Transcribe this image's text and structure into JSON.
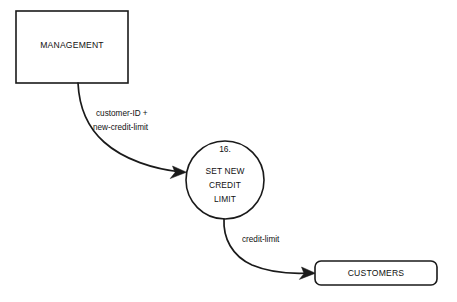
{
  "diagram": {
    "type": "data-flow-diagram",
    "background_color": "#ffffff",
    "line_color": "#1a1a1a",
    "text_color": "#111111"
  },
  "external_entities": [
    {
      "id": "management",
      "label": "MANAGEMENT",
      "shape": "rectangle",
      "x": 16,
      "y": 11,
      "width": 112,
      "height": 72
    },
    {
      "id": "customers",
      "label": "CUSTOMERS",
      "shape": "rounded-rectangle",
      "x": 315,
      "y": 261,
      "width": 122,
      "height": 24
    }
  ],
  "processes": [
    {
      "id": "set-new-credit-limit",
      "number": "16.",
      "label_lines": [
        "SET NEW",
        "CREDIT",
        "LIMIT"
      ],
      "shape": "circle",
      "cx": 225,
      "cy": 180,
      "r": 39
    }
  ],
  "data_flows": [
    {
      "id": "flow-customer-id-new-credit-limit",
      "label_lines": [
        "customer-ID +",
        "new-credit-limit"
      ],
      "from": "management",
      "to": "set-new-credit-limit",
      "label_x": 96,
      "label_y": 114
    },
    {
      "id": "flow-credit-limit",
      "label_lines": [
        "credit-limit"
      ],
      "from": "set-new-credit-limit",
      "to": "customers",
      "label_x": 242,
      "label_y": 240
    }
  ]
}
